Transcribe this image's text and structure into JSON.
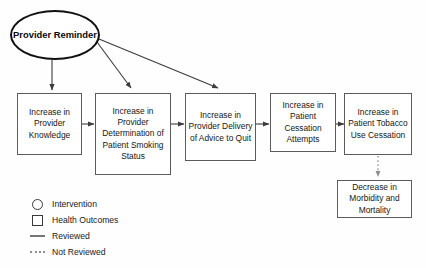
{
  "diagram": {
    "nodes": {
      "intervention": {
        "label": "Provider Reminder",
        "shape": "ellipse",
        "type": "Intervention"
      },
      "box1": {
        "label": "Increase in Provider Knowledge",
        "shape": "rectangle",
        "type": "Health Outcomes"
      },
      "box2": {
        "label": "Increase in Provider Determination of Patient Smoking Status",
        "shape": "rectangle",
        "type": "Health Outcomes"
      },
      "box3": {
        "label": "Increase in Provider Delivery of Advice to Quit",
        "shape": "rectangle",
        "type": "Health Outcomes"
      },
      "box4": {
        "label": "Increase in Patient Cessation Attempts",
        "shape": "rectangle",
        "type": "Health Outcomes"
      },
      "box5": {
        "label": "Increase in Patient Tobacco Use Cessation",
        "shape": "rectangle",
        "type": "Health Outcomes"
      },
      "box6": {
        "label": "Decrease in Morbidity and Mortality",
        "shape": "rectangle",
        "type": "Health Outcomes"
      }
    },
    "edges": [
      {
        "from": "intervention",
        "to": "box1",
        "style": "solid",
        "meaning": "Reviewed"
      },
      {
        "from": "intervention",
        "to": "box2",
        "style": "solid",
        "meaning": "Reviewed"
      },
      {
        "from": "intervention",
        "to": "box3",
        "style": "solid",
        "meaning": "Reviewed"
      },
      {
        "from": "box1",
        "to": "box2",
        "style": "solid",
        "meaning": "Reviewed"
      },
      {
        "from": "box2",
        "to": "box3",
        "style": "solid",
        "meaning": "Reviewed"
      },
      {
        "from": "box3",
        "to": "box4",
        "style": "solid",
        "meaning": "Reviewed"
      },
      {
        "from": "box4",
        "to": "box5",
        "style": "solid",
        "meaning": "Reviewed"
      },
      {
        "from": "box5",
        "to": "box6",
        "style": "dotted",
        "meaning": "Not Reviewed"
      }
    ],
    "legend": [
      {
        "key": "circle-icon",
        "label": "Intervention"
      },
      {
        "key": "square-icon",
        "label": "Health Outcomes"
      },
      {
        "key": "solid-line-icon",
        "label": "Reviewed"
      },
      {
        "key": "dotted-line-icon",
        "label": "Not Reviewed"
      }
    ],
    "colors": {
      "background": "#fefefe",
      "box_stroke": "#5b5b5b",
      "ellipse_stroke": "#111111",
      "text": "#161616",
      "edge_solid": "#3c3c3c",
      "edge_dotted": "#8d8d8d"
    }
  }
}
